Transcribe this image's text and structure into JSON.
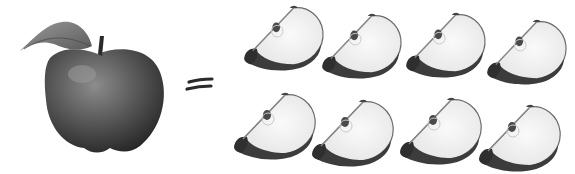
{
  "illustration": {
    "description": "One whole apple equals eight apple slices",
    "whole_apple": {
      "count": 1,
      "icon": "apple-icon"
    },
    "operator": {
      "symbol": "=",
      "icon": "equals-icon"
    },
    "slices": {
      "count": 8,
      "icon": "apple-slice-icon",
      "rows": [
        [
          {
            "x": 243,
            "y": 4,
            "rot": 0
          },
          {
            "x": 321,
            "y": 12,
            "rot": 2
          },
          {
            "x": 405,
            "y": 11,
            "rot": 0
          },
          {
            "x": 486,
            "y": 18,
            "rot": 2
          }
        ],
        [
          {
            "x": 233,
            "y": 91,
            "rot": 0
          },
          {
            "x": 311,
            "y": 98,
            "rot": 2
          },
          {
            "x": 399,
            "y": 96,
            "rot": 0
          },
          {
            "x": 478,
            "y": 103,
            "rot": 2
          }
        ]
      ]
    },
    "colors": {
      "background": "#ffffff",
      "apple_dark": "#2e2e2e",
      "apple_mid": "#5a5a5a",
      "apple_light": "#8a8a8a",
      "leaf": "#7a7a7a",
      "slice_flesh": "#f4f4f4",
      "slice_outline": "#6a6a6a",
      "slice_skin": "#3c3c3c"
    }
  }
}
